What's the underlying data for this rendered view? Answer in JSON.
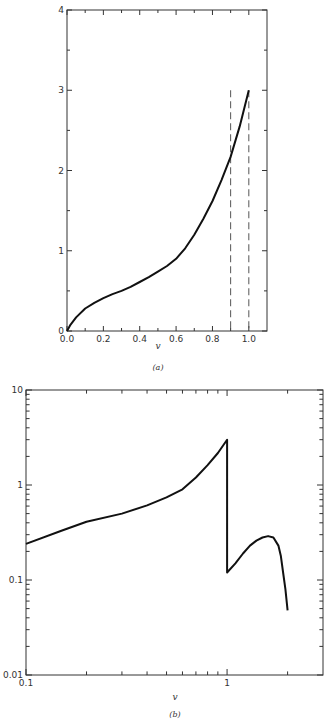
{
  "chart_data": [
    {
      "id": "a",
      "type": "line",
      "caption": "(a)",
      "xlabel": "v",
      "ylabel": "",
      "xscale": "linear",
      "yscale": "linear",
      "xlim": [
        0.0,
        1.1
      ],
      "ylim": [
        0,
        4
      ],
      "x_ticks": [
        0.0,
        0.2,
        0.4,
        0.6,
        0.8,
        1.0
      ],
      "x_tick_labels": [
        "0.0",
        "0.2",
        "0.4",
        "0.6",
        "0.8",
        "1.0"
      ],
      "x_minor_ticks": [
        0.1,
        0.3,
        0.5,
        0.7,
        0.9
      ],
      "y_ticks": [
        0,
        1,
        2,
        3,
        4
      ],
      "y_tick_labels": [
        "0",
        "1",
        "2",
        "3",
        "4"
      ],
      "y_minor_ticks": [
        0.5,
        1.5,
        2.5,
        3.5
      ],
      "grid": false,
      "series": [
        {
          "name": "curve",
          "x": [
            0.0,
            0.02,
            0.05,
            0.1,
            0.15,
            0.2,
            0.25,
            0.3,
            0.35,
            0.4,
            0.45,
            0.5,
            0.55,
            0.6,
            0.65,
            0.7,
            0.75,
            0.8,
            0.85,
            0.9,
            0.95,
            1.0
          ],
          "y": [
            0.0,
            0.08,
            0.17,
            0.28,
            0.35,
            0.41,
            0.46,
            0.5,
            0.55,
            0.61,
            0.67,
            0.74,
            0.81,
            0.9,
            1.03,
            1.2,
            1.4,
            1.62,
            1.88,
            2.17,
            2.55,
            3.0
          ]
        }
      ],
      "vlines": [
        {
          "x": 0.9,
          "y_top": 3.0,
          "style": "dashed"
        },
        {
          "x": 1.0,
          "y_top": 3.0,
          "style": "dashed"
        }
      ]
    },
    {
      "id": "b",
      "type": "line",
      "caption": "(b)",
      "xlabel": "v",
      "ylabel": "",
      "xscale": "log",
      "yscale": "log",
      "xlim": [
        0.1,
        3.0
      ],
      "ylim": [
        0.01,
        10
      ],
      "x_ticks": [
        0.1,
        1
      ],
      "x_tick_labels": [
        "0.1",
        "1"
      ],
      "x_minor_ticks": [
        0.2,
        0.3,
        0.4,
        0.5,
        0.6,
        0.7,
        0.8,
        0.9,
        2
      ],
      "y_ticks": [
        0.01,
        0.1,
        1,
        10
      ],
      "y_tick_labels": [
        "0.01",
        "0.1",
        "1",
        "10"
      ],
      "y_minor_ticks": [
        0.02,
        0.03,
        0.04,
        0.05,
        0.06,
        0.07,
        0.08,
        0.09,
        0.2,
        0.3,
        0.4,
        0.5,
        0.6,
        0.7,
        0.8,
        0.9,
        2,
        3,
        4,
        5,
        6,
        7,
        8,
        9
      ],
      "grid": false,
      "series": [
        {
          "name": "curve",
          "x": [
            0.1,
            0.15,
            0.2,
            0.3,
            0.4,
            0.5,
            0.6,
            0.7,
            0.8,
            0.9,
            1.0,
            1.0,
            1.1,
            1.2,
            1.3,
            1.4,
            1.5,
            1.6,
            1.7,
            1.8,
            1.85,
            1.9,
            1.95,
            2.0
          ],
          "y": [
            0.24,
            0.33,
            0.41,
            0.5,
            0.61,
            0.74,
            0.9,
            1.2,
            1.62,
            2.17,
            3.0,
            0.12,
            0.15,
            0.19,
            0.23,
            0.26,
            0.28,
            0.29,
            0.28,
            0.23,
            0.18,
            0.12,
            0.08,
            0.048
          ]
        }
      ]
    }
  ]
}
